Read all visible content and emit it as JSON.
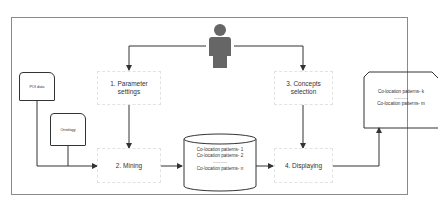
{
  "diagram": {
    "type": "flowchart",
    "actor": {
      "name": "user-icon"
    },
    "inputs": [
      {
        "id": "poi",
        "label": "POI data"
      },
      {
        "id": "ontology",
        "label": "Ontology"
      }
    ],
    "steps": [
      {
        "id": "param",
        "label_line1": "1. Parameter",
        "label_line2": "settings"
      },
      {
        "id": "mining",
        "label": "2. Mining"
      },
      {
        "id": "concepts",
        "label_line1": "3. Concepts",
        "label_line2": "selection"
      },
      {
        "id": "display",
        "label": "4. Displaying"
      }
    ],
    "database": {
      "lines": [
        "Co-location patterns- 1",
        "Co-location patterns- 2",
        "...........",
        "Co-location patterns- n"
      ]
    },
    "output": {
      "lines": [
        "Co-location patterns- k",
        "...........",
        "Co-location patterns- m"
      ]
    },
    "edges": [
      [
        "user",
        "param"
      ],
      [
        "user",
        "concepts"
      ],
      [
        "poi",
        "mining"
      ],
      [
        "ontology",
        "mining"
      ],
      [
        "param",
        "mining"
      ],
      [
        "mining",
        "database"
      ],
      [
        "database",
        "display"
      ],
      [
        "concepts",
        "display"
      ],
      [
        "display",
        "output"
      ]
    ],
    "colors": {
      "line": "#333333",
      "frame": "#8a8a8a",
      "user": "#666666",
      "box_border": "#e2e2e2"
    }
  }
}
